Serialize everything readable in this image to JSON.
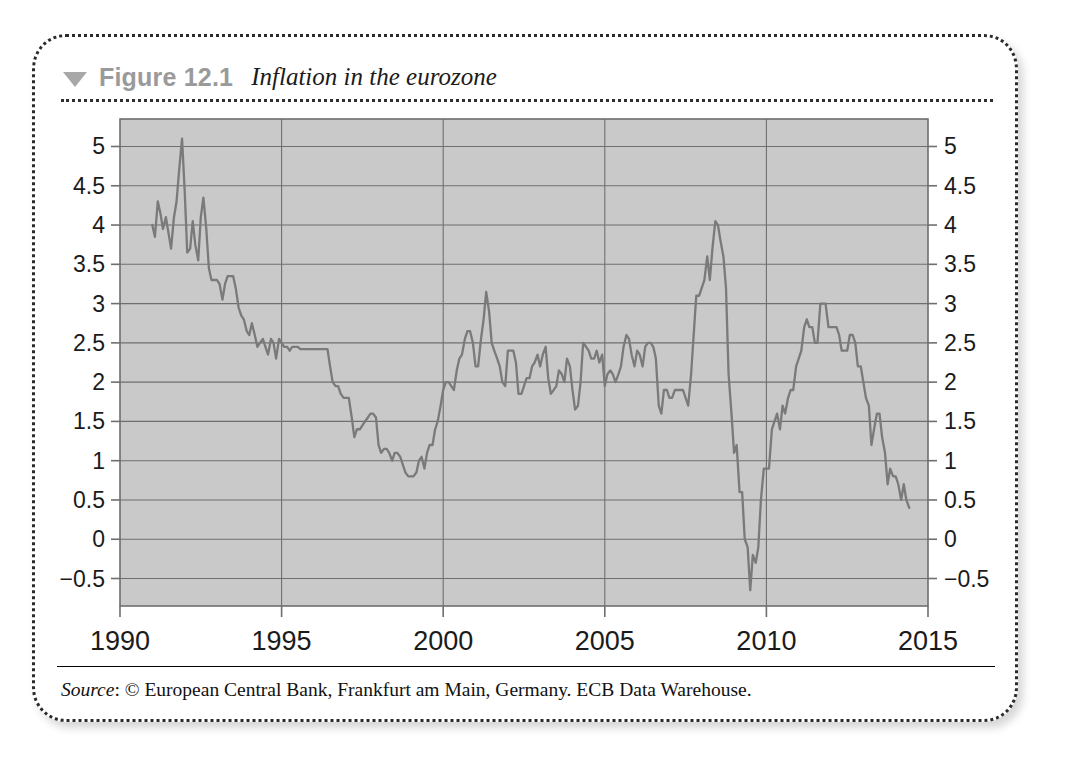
{
  "figure": {
    "triangle_icon": "triangle-down-icon",
    "label": "Figure 12.1",
    "title": "Inflation in the eurozone",
    "source_prefix": "Source",
    "source_body": ": © European Central Bank, Frankfurt am Main, Germany. ECB Data Warehouse."
  },
  "colors": {
    "plot_background": "#c9c9c9",
    "grid": "#6f6f6f",
    "series_line": "#7a7a7a",
    "axis_text": "#1b1b1b",
    "figure_label": "#9a9a9a",
    "border": "#2b2b2b"
  },
  "chart_data": {
    "type": "line",
    "title": "Inflation in the eurozone",
    "xlabel": "",
    "ylabel": "",
    "xlim": [
      1990,
      2015
    ],
    "ylim": [
      -0.85,
      5.35
    ],
    "grid": true,
    "legend": "none",
    "x_ticks": [
      "1990",
      "1995",
      "2000",
      "2005",
      "2010",
      "2015"
    ],
    "x_tick_values": [
      1990,
      1995,
      2000,
      2005,
      2010,
      2015
    ],
    "y_ticks": [
      "−0.5",
      "0",
      "0.5",
      "1",
      "1.5",
      "2",
      "2.5",
      "3",
      "3.5",
      "4",
      "4.5",
      "5"
    ],
    "y_tick_values": [
      -0.5,
      0,
      0.5,
      1,
      1.5,
      2,
      2.5,
      3,
      3.5,
      4,
      4.5,
      5
    ],
    "y_axis_duplicated_right": true,
    "series": [
      {
        "name": "Eurozone HICP inflation (annual %)",
        "x": [
          1991.0,
          1991.08,
          1991.17,
          1991.25,
          1991.33,
          1991.42,
          1991.5,
          1991.58,
          1991.67,
          1991.75,
          1991.83,
          1991.92,
          1992.0,
          1992.08,
          1992.17,
          1992.25,
          1992.33,
          1992.42,
          1992.5,
          1992.58,
          1992.67,
          1992.75,
          1992.83,
          1992.92,
          1993.0,
          1993.08,
          1993.17,
          1993.25,
          1993.33,
          1993.42,
          1993.5,
          1993.58,
          1993.67,
          1993.75,
          1993.83,
          1993.92,
          1994.0,
          1994.08,
          1994.17,
          1994.25,
          1994.33,
          1994.42,
          1994.5,
          1994.58,
          1994.67,
          1994.75,
          1994.83,
          1994.92,
          1995.0,
          1995.08,
          1995.17,
          1995.25,
          1995.33,
          1995.42,
          1995.5,
          1995.58,
          1995.67,
          1995.75,
          1995.83,
          1995.92,
          1996.0,
          1996.08,
          1996.17,
          1996.25,
          1996.33,
          1996.42,
          1996.5,
          1996.58,
          1996.67,
          1996.75,
          1996.83,
          1996.92,
          1997.0,
          1997.08,
          1997.17,
          1997.25,
          1997.33,
          1997.42,
          1997.5,
          1997.58,
          1997.67,
          1997.75,
          1997.83,
          1997.92,
          1998.0,
          1998.08,
          1998.17,
          1998.25,
          1998.33,
          1998.42,
          1998.5,
          1998.58,
          1998.67,
          1998.75,
          1998.83,
          1998.92,
          1999.0,
          1999.08,
          1999.17,
          1999.25,
          1999.33,
          1999.42,
          1999.5,
          1999.58,
          1999.67,
          1999.75,
          1999.83,
          1999.92,
          2000.0,
          2000.08,
          2000.17,
          2000.25,
          2000.33,
          2000.42,
          2000.5,
          2000.58,
          2000.67,
          2000.75,
          2000.83,
          2000.92,
          2001.0,
          2001.08,
          2001.17,
          2001.25,
          2001.33,
          2001.42,
          2001.5,
          2001.58,
          2001.67,
          2001.75,
          2001.83,
          2001.92,
          2002.0,
          2002.08,
          2002.17,
          2002.25,
          2002.33,
          2002.42,
          2002.5,
          2002.58,
          2002.67,
          2002.75,
          2002.83,
          2002.92,
          2003.0,
          2003.08,
          2003.17,
          2003.25,
          2003.33,
          2003.42,
          2003.5,
          2003.58,
          2003.67,
          2003.75,
          2003.83,
          2003.92,
          2004.0,
          2004.08,
          2004.17,
          2004.25,
          2004.33,
          2004.42,
          2004.5,
          2004.58,
          2004.67,
          2004.75,
          2004.83,
          2004.92,
          2005.0,
          2005.08,
          2005.17,
          2005.25,
          2005.33,
          2005.42,
          2005.5,
          2005.58,
          2005.67,
          2005.75,
          2005.83,
          2005.92,
          2006.0,
          2006.08,
          2006.17,
          2006.25,
          2006.33,
          2006.42,
          2006.5,
          2006.58,
          2006.67,
          2006.75,
          2006.83,
          2006.92,
          2007.0,
          2007.08,
          2007.17,
          2007.25,
          2007.33,
          2007.42,
          2007.5,
          2007.58,
          2007.67,
          2007.75,
          2007.83,
          2007.92,
          2008.0,
          2008.08,
          2008.17,
          2008.25,
          2008.33,
          2008.42,
          2008.5,
          2008.58,
          2008.67,
          2008.75,
          2008.83,
          2008.92,
          2009.0,
          2009.08,
          2009.17,
          2009.25,
          2009.33,
          2009.42,
          2009.5,
          2009.58,
          2009.67,
          2009.75,
          2009.83,
          2009.92,
          2010.0,
          2010.08,
          2010.17,
          2010.25,
          2010.33,
          2010.42,
          2010.5,
          2010.58,
          2010.67,
          2010.75,
          2010.83,
          2010.92,
          2011.0,
          2011.08,
          2011.17,
          2011.25,
          2011.33,
          2011.42,
          2011.5,
          2011.58,
          2011.67,
          2011.75,
          2011.83,
          2011.92,
          2012.0,
          2012.08,
          2012.17,
          2012.25,
          2012.33,
          2012.42,
          2012.5,
          2012.58,
          2012.67,
          2012.75,
          2012.83,
          2012.92,
          2013.0,
          2013.08,
          2013.17,
          2013.25,
          2013.33,
          2013.42,
          2013.5,
          2013.58,
          2013.67,
          2013.75,
          2013.83,
          2013.92,
          2014.0,
          2014.08,
          2014.17,
          2014.25,
          2014.33,
          2014.42
        ],
        "values": [
          4.0,
          3.85,
          4.3,
          4.15,
          3.95,
          4.1,
          3.9,
          3.7,
          4.1,
          4.3,
          4.7,
          5.1,
          4.45,
          3.65,
          3.7,
          4.05,
          3.75,
          3.55,
          4.1,
          4.35,
          3.95,
          3.45,
          3.3,
          3.3,
          3.3,
          3.25,
          3.05,
          3.25,
          3.35,
          3.35,
          3.35,
          3.2,
          2.95,
          2.85,
          2.8,
          2.65,
          2.6,
          2.75,
          2.6,
          2.45,
          2.5,
          2.55,
          2.45,
          2.35,
          2.55,
          2.5,
          2.3,
          2.55,
          2.5,
          2.45,
          2.45,
          2.4,
          2.45,
          2.45,
          2.45,
          2.42,
          2.42,
          2.42,
          2.42,
          2.42,
          2.42,
          2.42,
          2.42,
          2.42,
          2.42,
          2.42,
          2.2,
          2.0,
          1.95,
          1.95,
          1.85,
          1.8,
          1.8,
          1.8,
          1.55,
          1.3,
          1.4,
          1.4,
          1.45,
          1.5,
          1.55,
          1.6,
          1.6,
          1.55,
          1.2,
          1.1,
          1.15,
          1.15,
          1.1,
          1.0,
          1.1,
          1.1,
          1.05,
          0.95,
          0.85,
          0.8,
          0.8,
          0.8,
          0.85,
          1.0,
          1.05,
          0.9,
          1.1,
          1.2,
          1.2,
          1.4,
          1.5,
          1.7,
          1.9,
          2.0,
          2.0,
          1.95,
          1.9,
          2.15,
          2.3,
          2.35,
          2.55,
          2.65,
          2.65,
          2.5,
          2.2,
          2.2,
          2.55,
          2.8,
          3.15,
          2.9,
          2.5,
          2.4,
          2.3,
          2.2,
          2.0,
          1.95,
          2.4,
          2.4,
          2.4,
          2.25,
          1.85,
          1.85,
          1.95,
          2.05,
          2.05,
          2.2,
          2.25,
          2.35,
          2.2,
          2.35,
          2.45,
          2.05,
          1.85,
          1.9,
          1.95,
          2.15,
          2.1,
          2.0,
          2.3,
          2.2,
          1.9,
          1.65,
          1.7,
          2.0,
          2.5,
          2.45,
          2.4,
          2.3,
          2.3,
          2.4,
          2.25,
          2.35,
          1.95,
          2.1,
          2.15,
          2.1,
          2.0,
          2.1,
          2.2,
          2.45,
          2.6,
          2.55,
          2.35,
          2.2,
          2.4,
          2.35,
          2.2,
          2.45,
          2.5,
          2.5,
          2.45,
          2.3,
          1.7,
          1.6,
          1.9,
          1.9,
          1.8,
          1.8,
          1.9,
          1.9,
          1.9,
          1.9,
          1.8,
          1.7,
          2.1,
          2.6,
          3.1,
          3.1,
          3.2,
          3.3,
          3.6,
          3.3,
          3.7,
          4.05,
          4.0,
          3.8,
          3.6,
          3.2,
          2.1,
          1.6,
          1.1,
          1.2,
          0.6,
          0.6,
          0.0,
          -0.1,
          -0.65,
          -0.2,
          -0.3,
          -0.1,
          0.5,
          0.9,
          0.9,
          0.9,
          1.4,
          1.5,
          1.6,
          1.4,
          1.7,
          1.6,
          1.8,
          1.9,
          1.9,
          2.2,
          2.3,
          2.4,
          2.7,
          2.8,
          2.7,
          2.7,
          2.5,
          2.5,
          3.0,
          3.0,
          3.0,
          2.7,
          2.7,
          2.7,
          2.7,
          2.6,
          2.4,
          2.4,
          2.4,
          2.6,
          2.6,
          2.5,
          2.2,
          2.2,
          2.0,
          1.8,
          1.7,
          1.2,
          1.4,
          1.6,
          1.6,
          1.3,
          1.1,
          0.7,
          0.9,
          0.8,
          0.8,
          0.7,
          0.5,
          0.7,
          0.5,
          0.4
        ]
      }
    ]
  }
}
